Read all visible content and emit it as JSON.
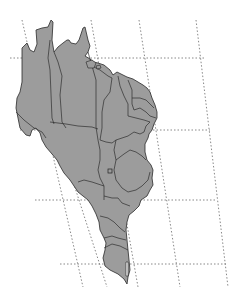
{
  "map": {
    "subject": "Brazil with state boundaries",
    "projection_style": "oblique graticule, dotted lines",
    "colors": {
      "land": "#9c9c9c",
      "border": "#2e2e2e",
      "graticule": "#7a7a7a",
      "background": "#ffffff"
    },
    "graticule": {
      "parallels": [
        {
          "y": 58,
          "x1": 10,
          "x2": 205
        },
        {
          "y": 130,
          "x1": 20,
          "x2": 210
        },
        {
          "y": 200,
          "x1": 35,
          "x2": 215
        },
        {
          "y": 264,
          "x1": 60,
          "x2": 227
        }
      ],
      "meridians": [
        {
          "x_top": 22,
          "y_top": 20,
          "x_bottom": 83,
          "y_bottom": 287
        },
        {
          "x_top": 50,
          "y_top": 110,
          "x_bottom": 107,
          "y_bottom": 287
        },
        {
          "x_top": 91,
          "y_top": 20,
          "x_bottom": 138,
          "y_bottom": 287
        },
        {
          "x_top": 139,
          "y_top": 20,
          "x_bottom": 180,
          "y_bottom": 287
        },
        {
          "x_top": 196,
          "y_top": 20,
          "x_bottom": 228,
          "y_bottom": 287
        }
      ]
    },
    "features": [
      {
        "name": "country-outline",
        "label": "Brazil"
      },
      {
        "name": "federal-district-marker",
        "label": "Distrito Federal"
      }
    ]
  }
}
